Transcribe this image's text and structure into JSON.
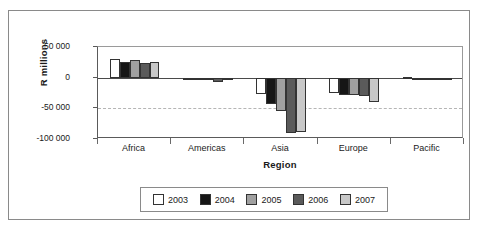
{
  "chart_data": {
    "type": "bar",
    "title": "",
    "subtitle": "",
    "xlabel": "Region",
    "ylabel": "R millions",
    "categories": [
      "Africa",
      "Americas",
      "Asia",
      "Europe",
      "Pacific"
    ],
    "series": [
      {
        "name": "2003",
        "color": "#ffffff",
        "values": [
          31000,
          -2000,
          -26000,
          -25000,
          1000
        ]
      },
      {
        "name": "2004",
        "color": "#161616",
        "values": [
          26000,
          -3000,
          -43000,
          -29000,
          -1000
        ]
      },
      {
        "name": "2005",
        "color": "#a0a0a0",
        "values": [
          29000,
          -4000,
          -54000,
          -29000,
          -1000
        ]
      },
      {
        "name": "2006",
        "color": "#5a5a5a",
        "values": [
          24000,
          -7000,
          -91000,
          -30000,
          -2000
        ]
      },
      {
        "name": "2007",
        "color": "#c8c8c8",
        "values": [
          25000,
          -4000,
          -88000,
          -39000,
          -3000
        ]
      }
    ],
    "ylim": [
      -100000,
      50000
    ],
    "yticks": [
      50000,
      0,
      -50000,
      -100000
    ],
    "ytick_labels": [
      "50 000",
      "0",
      "-50 000",
      "-100 000"
    ],
    "grid": "dashed horizontal gridline at -50 000",
    "zero_line": true,
    "legend_position": "bottom",
    "legend_entries": [
      "2003",
      "2004",
      "2005",
      "2006",
      "2007"
    ]
  },
  "axes": {
    "y_title": "R millions",
    "x_title": "Region"
  }
}
